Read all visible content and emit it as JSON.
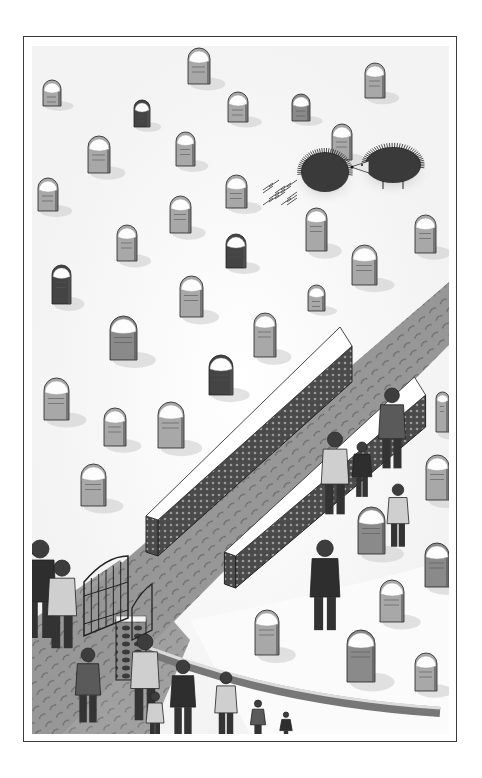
{
  "illustration": {
    "subject": "snowy churchyard with tombstones, two hedgehogs, snow-topped stone walls and visitors",
    "frame": {
      "x": 23,
      "y": 36,
      "w": 434,
      "h": 706,
      "border": "#3a3a3a"
    },
    "colors": {
      "snow": "#fafafa",
      "path": "#9a9a9a",
      "path_dark": "#6e6e6e",
      "stone_light": "#a8a8a8",
      "stone_mid": "#8a8a8a",
      "stone_dark": "#444444",
      "wall_side": "#3c3c3c",
      "wall_top": "#ffffff",
      "figure": "#5a5a5a",
      "figure_dark": "#2e2e2e",
      "hedgehog": "#3a3a3a",
      "ink": "#222222"
    },
    "tombstones": [
      {
        "x": 188,
        "y": 48,
        "w": 22,
        "h": 36,
        "tone": "light"
      },
      {
        "x": 43,
        "y": 80,
        "w": 18,
        "h": 26,
        "tone": "light"
      },
      {
        "x": 134,
        "y": 100,
        "w": 16,
        "h": 27,
        "tone": "dark"
      },
      {
        "x": 228,
        "y": 92,
        "w": 20,
        "h": 30,
        "tone": "light"
      },
      {
        "x": 292,
        "y": 94,
        "w": 18,
        "h": 27,
        "tone": "mid"
      },
      {
        "x": 365,
        "y": 63,
        "w": 20,
        "h": 35,
        "tone": "light"
      },
      {
        "x": 88,
        "y": 136,
        "w": 22,
        "h": 37,
        "tone": "light"
      },
      {
        "x": 176,
        "y": 132,
        "w": 19,
        "h": 34,
        "tone": "light"
      },
      {
        "x": 332,
        "y": 124,
        "w": 20,
        "h": 36,
        "tone": "light"
      },
      {
        "x": 38,
        "y": 178,
        "w": 20,
        "h": 33,
        "tone": "light"
      },
      {
        "x": 226,
        "y": 175,
        "w": 21,
        "h": 33,
        "tone": "light"
      },
      {
        "x": 170,
        "y": 196,
        "w": 21,
        "h": 37,
        "tone": "light"
      },
      {
        "x": 306,
        "y": 208,
        "w": 21,
        "h": 43,
        "tone": "light"
      },
      {
        "x": 415,
        "y": 215,
        "w": 21,
        "h": 38,
        "tone": "light"
      },
      {
        "x": 117,
        "y": 225,
        "w": 20,
        "h": 36,
        "tone": "light"
      },
      {
        "x": 226,
        "y": 234,
        "w": 20,
        "h": 34,
        "tone": "dark"
      },
      {
        "x": 352,
        "y": 245,
        "w": 25,
        "h": 40,
        "tone": "light"
      },
      {
        "x": 52,
        "y": 265,
        "w": 19,
        "h": 39,
        "tone": "dark"
      },
      {
        "x": 180,
        "y": 276,
        "w": 23,
        "h": 41,
        "tone": "light"
      },
      {
        "x": 308,
        "y": 285,
        "w": 17,
        "h": 26,
        "tone": "light"
      },
      {
        "x": 110,
        "y": 316,
        "w": 27,
        "h": 44,
        "tone": "mid"
      },
      {
        "x": 254,
        "y": 313,
        "w": 22,
        "h": 44,
        "tone": "light"
      },
      {
        "x": 209,
        "y": 355,
        "w": 24,
        "h": 40,
        "tone": "dark"
      },
      {
        "x": 44,
        "y": 378,
        "w": 25,
        "h": 42,
        "tone": "light"
      },
      {
        "x": 104,
        "y": 408,
        "w": 22,
        "h": 38,
        "tone": "light"
      },
      {
        "x": 158,
        "y": 402,
        "w": 26,
        "h": 46,
        "tone": "light"
      },
      {
        "x": 436,
        "y": 392,
        "w": 13,
        "h": 40,
        "tone": "light"
      },
      {
        "x": 81,
        "y": 464,
        "w": 25,
        "h": 42,
        "tone": "light"
      },
      {
        "x": 426,
        "y": 455,
        "w": 23,
        "h": 45,
        "tone": "light"
      },
      {
        "x": 358,
        "y": 507,
        "w": 27,
        "h": 47,
        "tone": "mid"
      },
      {
        "x": 425,
        "y": 543,
        "w": 24,
        "h": 44,
        "tone": "mid"
      },
      {
        "x": 380,
        "y": 580,
        "w": 24,
        "h": 42,
        "tone": "light"
      },
      {
        "x": 255,
        "y": 610,
        "w": 24,
        "h": 45,
        "tone": "light"
      },
      {
        "x": 347,
        "y": 630,
        "w": 28,
        "h": 52,
        "tone": "mid"
      },
      {
        "x": 415,
        "y": 653,
        "w": 22,
        "h": 38,
        "tone": "light"
      }
    ],
    "hedgehogs": [
      {
        "name": "hedgehog-curled",
        "cx": 325,
        "cy": 172,
        "rx": 24,
        "ry": 20,
        "dropped_quills": true
      },
      {
        "name": "hedgehog-walking",
        "cx": 393,
        "cy": 165,
        "rx": 28,
        "ry": 18,
        "facing": "left"
      }
    ],
    "walls": [
      {
        "name": "long-wall",
        "x1": 152,
        "y1": 520,
        "x2": 346,
        "y2": 346,
        "thickness": 30,
        "height": 36
      },
      {
        "name": "short-wall",
        "x1": 230,
        "y1": 556,
        "x2": 420,
        "y2": 395,
        "thickness": 28,
        "height": 32
      }
    ],
    "gate": {
      "x": 84,
      "y": 556,
      "w": 44,
      "h": 80
    },
    "people": [
      {
        "x": 40,
        "y": 540,
        "h": 100,
        "tone": "dark",
        "label": "bearded-man"
      },
      {
        "x": 62,
        "y": 560,
        "h": 90,
        "tone": "light",
        "label": "woman-in-coat"
      },
      {
        "x": 88,
        "y": 648,
        "h": 76,
        "tone": "mid",
        "label": "child"
      },
      {
        "x": 145,
        "y": 634,
        "h": 88,
        "tone": "light",
        "label": "person-at-wall"
      },
      {
        "x": 183,
        "y": 660,
        "h": 76,
        "tone": "dark",
        "label": "person-at-wall-2"
      },
      {
        "x": 226,
        "y": 672,
        "h": 66,
        "tone": "light",
        "label": "blonde-person"
      },
      {
        "x": 258,
        "y": 700,
        "h": 40,
        "tone": "mid",
        "label": "child-2"
      },
      {
        "x": 286,
        "y": 712,
        "h": 30,
        "tone": "dark",
        "label": "child-3"
      },
      {
        "x": 155,
        "y": 692,
        "h": 50,
        "tone": "light",
        "label": "small-child"
      },
      {
        "x": 335,
        "y": 432,
        "h": 84,
        "tone": "light",
        "label": "adult-with-child"
      },
      {
        "x": 362,
        "y": 442,
        "h": 56,
        "tone": "dark",
        "label": "child-at-wall"
      },
      {
        "x": 392,
        "y": 388,
        "h": 82,
        "tone": "mid",
        "label": "man-at-wall"
      },
      {
        "x": 398,
        "y": 484,
        "h": 64,
        "tone": "light",
        "label": "boy-standing"
      },
      {
        "x": 325,
        "y": 540,
        "h": 92,
        "tone": "dark",
        "label": "man-walking"
      }
    ]
  }
}
